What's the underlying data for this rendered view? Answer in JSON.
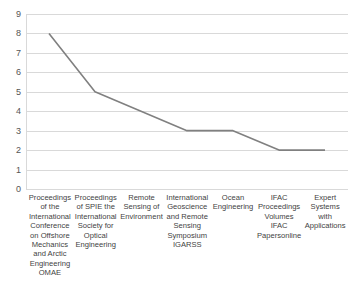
{
  "chart_data": {
    "type": "line",
    "title": "",
    "subtitle": "",
    "xlabel": "",
    "ylabel": "",
    "categories": [
      "Proceedings of the International Conference on Offshore Mechanics and Arctic Engineering OMAE",
      "Proceedings of SPIE the International Society for Optical Engineering",
      "Remote Sensing of Environment",
      "International Geoscience and Remote Sensing Symposium IGARSS",
      "Ocean Engineering",
      "IFAC Proceedings Volumes IFAC Papersonline",
      "Expert Systems with Applications"
    ],
    "values": [
      8,
      5,
      4,
      3,
      3,
      2,
      2
    ],
    "ylim": [
      0,
      9
    ],
    "y_ticks": [
      9,
      8,
      7,
      6,
      5,
      4,
      3,
      2,
      1,
      0
    ],
    "grid": true,
    "legend": "none",
    "series_color": "#808080",
    "gridline_color": "#d9d9d9"
  },
  "axis": {
    "y_tick_labels": [
      "9",
      "8",
      "7",
      "6",
      "5",
      "4",
      "3",
      "2",
      "1",
      "0"
    ]
  }
}
